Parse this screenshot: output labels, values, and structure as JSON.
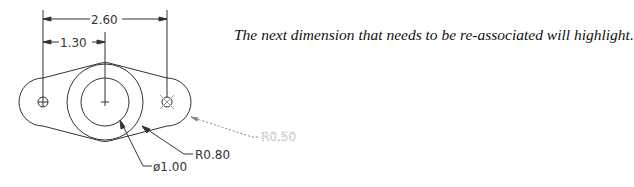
{
  "caption": "The next dimension that needs to be re-associated will highlight.",
  "drawing": {
    "dimensions": {
      "overall_width": "2.60",
      "half_width": "1.30",
      "outer_radius": "R0.80",
      "inner_diameter": "ø1.00",
      "end_radius_highlighted": "R0.50"
    },
    "colors": {
      "line": "#333333",
      "highlight": "#888888",
      "background": "#ffffff"
    }
  }
}
